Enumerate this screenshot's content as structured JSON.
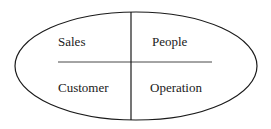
{
  "diagram": {
    "type": "quadrant-ellipse",
    "quadrants": {
      "top_left": "Sales",
      "top_right": "People",
      "bottom_left": "Customer",
      "bottom_right": "Operation"
    },
    "colors": {
      "stroke": "#1a1a1a",
      "background": "#ffffff",
      "text": "#1a1a1a"
    }
  }
}
